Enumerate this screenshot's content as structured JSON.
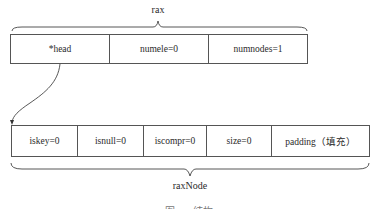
{
  "rax": {
    "label": "rax",
    "fields": [
      {
        "name": "head",
        "text": "*head"
      },
      {
        "name": "numele",
        "text": "numele=0"
      },
      {
        "name": "numnodes",
        "text": "numnodes=1"
      }
    ]
  },
  "raxNode": {
    "label": "raxNode",
    "fields": [
      {
        "name": "iskey",
        "text": "iskey=0"
      },
      {
        "name": "isnull",
        "text": "isnull=0"
      },
      {
        "name": "iscompr",
        "text": "iscompr=0"
      },
      {
        "name": "size",
        "text": "size=0"
      },
      {
        "name": "padding",
        "text": "padding（填充）"
      }
    ]
  },
  "arrow": {
    "from": "rax.head",
    "to": "raxNode"
  },
  "caption": "图 rax 结构"
}
